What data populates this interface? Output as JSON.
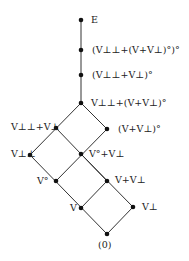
{
  "diagram": {
    "type": "lattice",
    "nodes": [
      {
        "id": "E",
        "label": "E",
        "x": 81,
        "y": 20
      },
      {
        "id": "n1",
        "label": "(V⊥⊥+(V+V⊥)°)°",
        "x": 81,
        "y": 50
      },
      {
        "id": "n2",
        "label": "(V⊥⊥+V⊥)°",
        "x": 81,
        "y": 75
      },
      {
        "id": "n3",
        "label": "V⊥⊥+(V+V⊥)°",
        "x": 81,
        "y": 103
      },
      {
        "id": "n4",
        "label": "V⊥⊥+V⊥",
        "x": 56,
        "y": 128
      },
      {
        "id": "n5",
        "label": "(V+V⊥)°",
        "x": 107,
        "y": 129
      },
      {
        "id": "n6",
        "label": "V⊥⊥",
        "x": 30,
        "y": 155
      },
      {
        "id": "n7",
        "label": "V°+V⊥",
        "x": 81,
        "y": 154
      },
      {
        "id": "n8",
        "label": "V°",
        "x": 56,
        "y": 181
      },
      {
        "id": "n9",
        "label": "V+V⊥",
        "x": 107,
        "y": 181
      },
      {
        "id": "n10",
        "label": "V",
        "x": 81,
        "y": 208
      },
      {
        "id": "n11",
        "label": "V⊥",
        "x": 133,
        "y": 207
      },
      {
        "id": "n12",
        "label": "(0)",
        "x": 107,
        "y": 234
      }
    ],
    "edges": [
      [
        "E",
        "n1"
      ],
      [
        "n1",
        "n2"
      ],
      [
        "n2",
        "n3"
      ],
      [
        "n3",
        "n4"
      ],
      [
        "n3",
        "n5"
      ],
      [
        "n4",
        "n6"
      ],
      [
        "n4",
        "n7"
      ],
      [
        "n5",
        "n7"
      ],
      [
        "n6",
        "n8"
      ],
      [
        "n7",
        "n8"
      ],
      [
        "n7",
        "n9"
      ],
      [
        "n8",
        "n10"
      ],
      [
        "n9",
        "n10"
      ],
      [
        "n9",
        "n11"
      ],
      [
        "n10",
        "n12"
      ],
      [
        "n11",
        "n12"
      ]
    ]
  },
  "labels": {
    "E": "E",
    "n1": "(V⊥⊥+(V+V⊥)°)°",
    "n2": "(V⊥⊥+V⊥)°",
    "n3": "V⊥⊥+(V+V⊥)°",
    "n4": "V⊥⊥+V⊥",
    "n5": "(V+V⊥)°",
    "n6": "V⊥⊥",
    "n7": "V°+V⊥",
    "n8": "V°",
    "n9": "V+V⊥",
    "n10": "V",
    "n11": "V⊥",
    "n12": "(0)"
  }
}
